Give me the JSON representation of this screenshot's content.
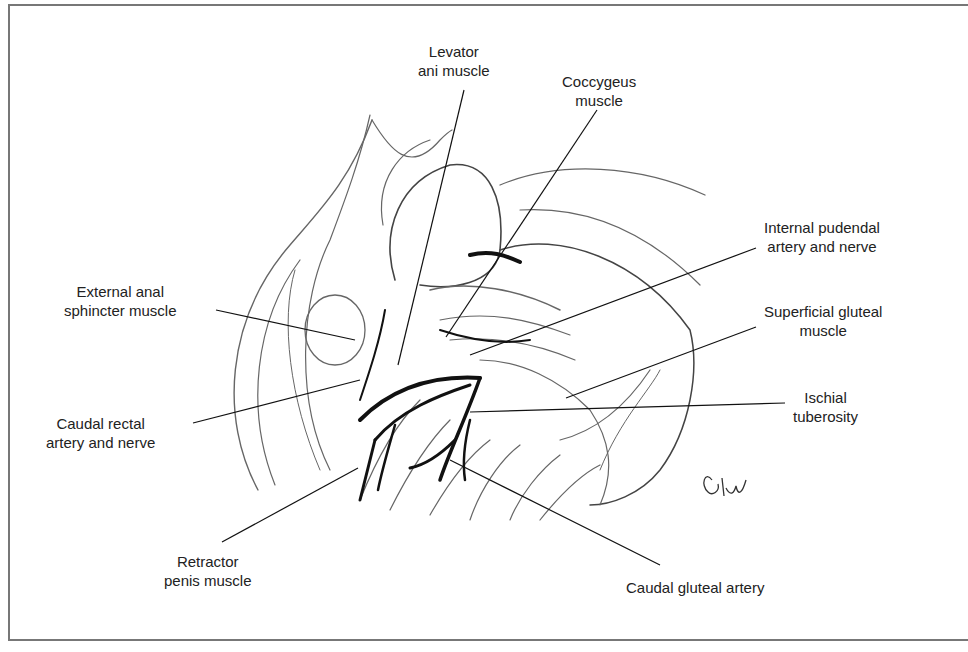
{
  "figure": {
    "type": "anatomical-illustration",
    "signature": "Eew",
    "labels": [
      {
        "id": "levator-ani-muscle",
        "line1": "Levator",
        "line2": "ani muscle"
      },
      {
        "id": "coccygeus-muscle",
        "line1": "Coccygeus",
        "line2": "muscle"
      },
      {
        "id": "internal-pudendal-artery-and-nerve",
        "line1": "Internal pudendal",
        "line2": "artery and nerve"
      },
      {
        "id": "external-anal-sphincter-muscle",
        "line1": "External anal",
        "line2": "sphincter muscle"
      },
      {
        "id": "superficial-gluteal-muscle",
        "line1": "Superficial gluteal",
        "line2": "muscle"
      },
      {
        "id": "caudal-rectal-artery-and-nerve",
        "line1": "Caudal rectal",
        "line2": "artery and nerve"
      },
      {
        "id": "ischial-tuberosity",
        "line1": "Ischial",
        "line2": "tuberosity"
      },
      {
        "id": "retractor-penis-muscle",
        "line1": "Retractor",
        "line2": "penis muscle"
      },
      {
        "id": "caudal-gluteal-artery",
        "line1": "Caudal gluteal artery",
        "line2": ""
      }
    ]
  },
  "colors": {
    "ink": "#222222",
    "frame": "#777777",
    "sketch": "#555555",
    "background": "#ffffff"
  }
}
